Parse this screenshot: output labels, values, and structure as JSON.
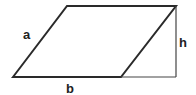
{
  "diagram": {
    "labels": {
      "side": "a",
      "base": "b",
      "height": "h"
    },
    "colors": {
      "stroke": "#2a2a2a",
      "height_stroke": "#444444",
      "background": "#ffffff"
    }
  }
}
